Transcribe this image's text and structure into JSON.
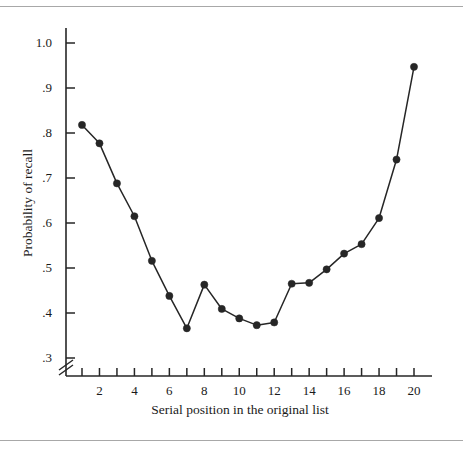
{
  "figure": {
    "has_top_rule": true,
    "has_bottom_rule": true,
    "rule_color": "#a8a8a8",
    "background_color": "#ffffff"
  },
  "chart_data": {
    "type": "line",
    "title": "",
    "xlabel": "Serial position in the original list",
    "ylabel": "Probability of recall",
    "x": [
      1,
      2,
      3,
      4,
      5,
      6,
      7,
      8,
      9,
      10,
      11,
      12,
      13,
      14,
      15,
      16,
      17,
      18,
      19,
      20
    ],
    "values": [
      0.818,
      0.777,
      0.688,
      0.615,
      0.516,
      0.438,
      0.366,
      0.463,
      0.409,
      0.388,
      0.373,
      0.379,
      0.465,
      0.467,
      0.497,
      0.532,
      0.553,
      0.611,
      0.741,
      0.947
    ],
    "xlim": [
      1,
      20
    ],
    "ylim": [
      0.3,
      1.0
    ],
    "grid": false,
    "legend": null,
    "axis_break_y": true,
    "axis_break_note": "y-axis broken below .3",
    "marker": "filled-circle",
    "marker_color": "#262626",
    "line_color": "#262626",
    "y_tick_labels": [
      "1.0",
      ".9",
      ".8",
      ".7",
      ".6",
      ".5",
      ".4",
      ".3"
    ],
    "y_tick_values": [
      1.0,
      0.9,
      0.8,
      0.7,
      0.6,
      0.5,
      0.4,
      0.3
    ],
    "x_tick_values": [
      1,
      2,
      3,
      4,
      5,
      6,
      7,
      8,
      9,
      10,
      11,
      12,
      13,
      14,
      15,
      16,
      17,
      18,
      19,
      20
    ],
    "x_tick_labels_shown": [
      "2",
      "4",
      "6",
      "8",
      "10",
      "12",
      "14",
      "16",
      "18",
      "20"
    ],
    "x_tick_label_values": [
      2,
      4,
      6,
      8,
      10,
      12,
      14,
      16,
      18,
      20
    ]
  }
}
